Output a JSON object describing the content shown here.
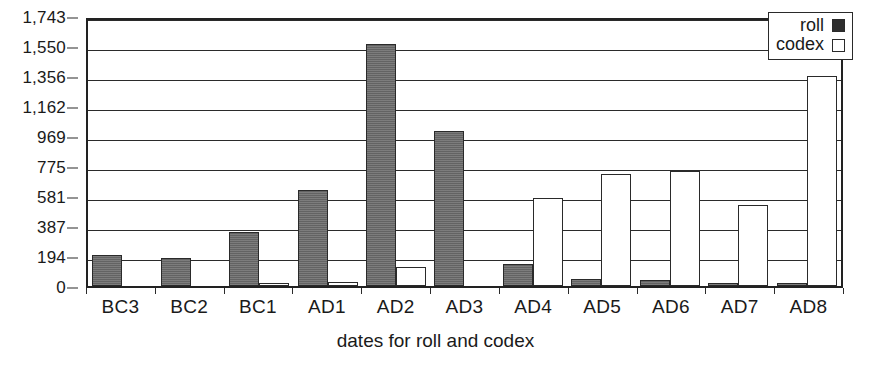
{
  "chart_data": {
    "type": "bar",
    "title": "",
    "xlabel": "dates for roll and codex",
    "ylabel": "",
    "categories": [
      "BC3",
      "BC2",
      "BC1",
      "AD1",
      "AD2",
      "AD3",
      "AD4",
      "AD5",
      "AD6",
      "AD7",
      "AD8"
    ],
    "series": [
      {
        "name": "roll",
        "color": "#6e6e6e",
        "values": [
          200,
          180,
          350,
          620,
          1565,
          1000,
          145,
          45,
          38,
          20,
          18
        ]
      },
      {
        "name": "codex",
        "color": "#ffffff",
        "values": [
          0,
          0,
          22,
          25,
          120,
          0,
          570,
          720,
          740,
          520,
          1356
        ]
      }
    ],
    "ylim": [
      0,
      1743
    ],
    "yticks": [
      0,
      194,
      387,
      581,
      775,
      969,
      1162,
      1356,
      1550,
      1743
    ],
    "ytick_labels": [
      "0",
      "194",
      "387",
      "581",
      "775",
      "969",
      "1,162",
      "1,356",
      "1,550",
      "1,743"
    ],
    "grid": true,
    "legend_position": "top-right"
  },
  "legend": {
    "items": [
      {
        "label": "roll",
        "marker": "filled-square-icon"
      },
      {
        "label": "codex",
        "marker": "empty-square-icon"
      }
    ]
  },
  "axes": {
    "x_title": "dates for roll and codex"
  }
}
